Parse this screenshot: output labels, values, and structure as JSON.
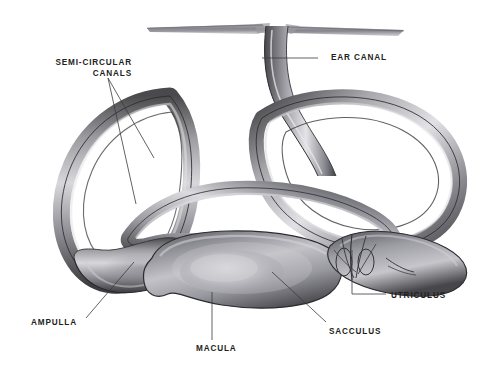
{
  "figure": {
    "style": "grayscale pencil/airbrush anatomical illustration",
    "background_color": "#ffffff",
    "ink_color": "#231f20"
  },
  "labels": [
    {
      "id": "semi-circular-canals",
      "line1": "SEMI-CIRCULAR",
      "line2": "CANALS",
      "text": "SEMI-CIRCULAR CANALS"
    },
    {
      "id": "ear-canal",
      "line1": "EAR CANAL",
      "line2": "",
      "text": "EAR CANAL"
    },
    {
      "id": "ampulla",
      "line1": "AMPULLA",
      "line2": "",
      "text": "AMPULLA"
    },
    {
      "id": "macula",
      "line1": "MACULA",
      "line2": "",
      "text": "MACULA"
    },
    {
      "id": "sacculus",
      "line1": "SACCULUS",
      "line2": "",
      "text": "SACCULUS"
    },
    {
      "id": "utriculus",
      "line1": "UTRICULUS",
      "line2": "",
      "text": "UTRICULUS"
    }
  ],
  "structures": [
    {
      "id": "membrane-sheet",
      "name": "flat membrane sheet"
    },
    {
      "id": "ear-canal-tube",
      "name": "ear canal tube"
    },
    {
      "id": "anterior-canal",
      "name": "anterior semi-circular canal"
    },
    {
      "id": "lateral-canal",
      "name": "lateral semi-circular canal"
    },
    {
      "id": "posterior-canal",
      "name": "posterior semi-circular canal"
    },
    {
      "id": "ampulla-bulge",
      "name": "ampulla swelling"
    },
    {
      "id": "sacculus-sac",
      "name": "sacculus sac"
    },
    {
      "id": "macula-patch",
      "name": "macula sensory patch"
    },
    {
      "id": "utriculus-chamber",
      "name": "utriculus chamber"
    }
  ]
}
